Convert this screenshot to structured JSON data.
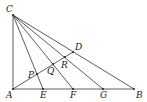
{
  "diagram": {
    "type": "geometry-figure",
    "points": {
      "C": {
        "label": "C",
        "x": 13,
        "y": 15
      },
      "A": {
        "label": "A",
        "x": 13,
        "y": 89
      },
      "E": {
        "label": "E",
        "x": 43,
        "y": 89
      },
      "F": {
        "label": "F",
        "x": 73,
        "y": 89
      },
      "G": {
        "label": "G",
        "x": 103,
        "y": 89
      },
      "B": {
        "label": "B",
        "x": 134,
        "y": 89
      },
      "D": {
        "label": "D",
        "x": 73,
        "y": 52
      },
      "R": {
        "label": "R",
        "x": 65,
        "y": 58
      },
      "Q": {
        "label": "Q",
        "x": 53,
        "y": 65
      },
      "P": {
        "label": "P",
        "x": 37,
        "y": 75
      }
    },
    "segments": [
      "CA",
      "AB",
      "CB",
      "CE",
      "CF",
      "CG",
      "AD"
    ],
    "colors": {
      "stroke": "#333333",
      "text": "#222222",
      "background": "#ffffff"
    }
  }
}
